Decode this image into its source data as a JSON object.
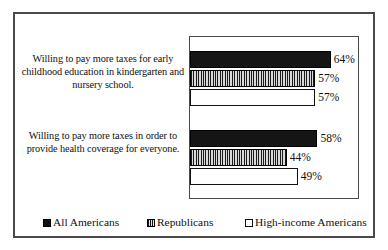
{
  "chart_data": {
    "type": "bar",
    "orientation": "horizontal",
    "title": "",
    "subtitle": "",
    "xlabel": "",
    "ylabel": "",
    "xlim": [
      0,
      100
    ],
    "grid": false,
    "legend_position": "bottom",
    "categories": [
      "Willing to pay more taxes for early childhood education in kindergarten and nursery school.",
      "Willing to pay more taxes in order to provide health coverage for everyone."
    ],
    "series": [
      {
        "name": "All Americans",
        "values": [
          64,
          57
        ],
        "labels": [
          "64%",
          "58%"
        ],
        "color": "#151515",
        "pattern": "solid"
      },
      {
        "name": "Republicans",
        "values": [
          57,
          44
        ],
        "labels": [
          "57%",
          "44%"
        ],
        "color": "#b4b4b4",
        "pattern": "vertical-stripes"
      },
      {
        "name": "High-income Americans",
        "values": [
          57,
          49
        ],
        "labels": [
          "57%",
          "49%"
        ],
        "color": "#ffffff",
        "pattern": "empty"
      }
    ],
    "data_labels": [
      [
        "64%",
        "57%",
        "57%"
      ],
      [
        "58%",
        "44%",
        "49%"
      ]
    ]
  },
  "categories": [
    {
      "label": "Willing to pay more taxes for early childhood education in kindergarten and nursery school."
    },
    {
      "label": "Willing to pay more taxes in order to provide health coverage for everyone."
    }
  ],
  "groups": [
    {
      "bars": [
        {
          "series": "All Americans",
          "value": 64,
          "label": "64%"
        },
        {
          "series": "Republicans",
          "value": 57,
          "label": "57%"
        },
        {
          "series": "High-income Americans",
          "value": 57,
          "label": "57%"
        }
      ]
    },
    {
      "bars": [
        {
          "series": "All Americans",
          "value": 58,
          "label": "58%"
        },
        {
          "series": "Republicans",
          "value": 44,
          "label": "44%"
        },
        {
          "series": "High-income Americans",
          "value": 49,
          "label": "49%"
        }
      ]
    }
  ],
  "legend": {
    "items": [
      {
        "label": "All Americans",
        "color": "#151515"
      },
      {
        "label": "Republicans",
        "color": "#b4b4b4"
      },
      {
        "label": "High-income Americans",
        "color": "#ffffff"
      }
    ]
  }
}
